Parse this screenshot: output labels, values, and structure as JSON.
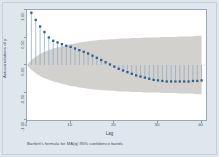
{
  "figure": {
    "note": "Bartlett's formula for MA(q) 95% confidence bands",
    "frame_color": "#dfe7ee",
    "plot_bg": "#ffffff"
  },
  "chart_data": {
    "type": "line",
    "plot_kind": "autocorrelation-spike-plot",
    "title": "",
    "xlabel": "Lag",
    "ylabel": "Autocorrelations of y",
    "xlim": [
      0,
      41
    ],
    "ylim": [
      -1.0,
      1.0
    ],
    "xticks": [
      0,
      10,
      20,
      30,
      40
    ],
    "xtick_labels": [
      "0",
      "10",
      "20",
      "30",
      "40"
    ],
    "yticks": [
      -1.0,
      -0.5,
      0.0,
      0.5,
      1.0
    ],
    "ytick_labels": [
      "-1.00",
      "-0.50",
      "0.00",
      "0.50",
      "1.00"
    ],
    "grid": false,
    "legend": false,
    "marker_color": "#33608f",
    "spike_color": "#8fa9c4",
    "band_color": "#b8b4ae",
    "band_label": "Bartlett's formula for MA(q) 95% confidence bands",
    "x": [
      1,
      2,
      3,
      4,
      5,
      6,
      7,
      8,
      9,
      10,
      11,
      12,
      13,
      14,
      15,
      16,
      17,
      18,
      19,
      20,
      21,
      22,
      23,
      24,
      25,
      26,
      27,
      28,
      29,
      30,
      31,
      32,
      33,
      34,
      35,
      36,
      37,
      38,
      39,
      40
    ],
    "values": [
      0.95,
      0.82,
      0.7,
      0.6,
      0.5,
      0.44,
      0.41,
      0.38,
      0.35,
      0.33,
      0.3,
      0.27,
      0.24,
      0.21,
      0.17,
      0.13,
      0.09,
      0.05,
      0.01,
      -0.03,
      -0.07,
      -0.1,
      -0.13,
      -0.16,
      -0.19,
      -0.21,
      -0.23,
      -0.25,
      -0.27,
      -0.28,
      -0.29,
      -0.3,
      -0.3,
      -0.3,
      -0.3,
      -0.3,
      -0.3,
      -0.29,
      -0.29,
      -0.28
    ],
    "confidence_upper": [
      0.09,
      0.15,
      0.2,
      0.24,
      0.27,
      0.3,
      0.32,
      0.34,
      0.36,
      0.38,
      0.39,
      0.41,
      0.42,
      0.43,
      0.44,
      0.45,
      0.46,
      0.46,
      0.47,
      0.47,
      0.48,
      0.48,
      0.48,
      0.49,
      0.49,
      0.49,
      0.5,
      0.5,
      0.5,
      0.5,
      0.51,
      0.51,
      0.51,
      0.51,
      0.52,
      0.52,
      0.52,
      0.52,
      0.53,
      0.53
    ],
    "confidence_lower": [
      -0.09,
      -0.15,
      -0.2,
      -0.24,
      -0.27,
      -0.3,
      -0.32,
      -0.34,
      -0.36,
      -0.38,
      -0.39,
      -0.41,
      -0.42,
      -0.43,
      -0.44,
      -0.45,
      -0.46,
      -0.46,
      -0.47,
      -0.47,
      -0.48,
      -0.48,
      -0.48,
      -0.49,
      -0.49,
      -0.49,
      -0.5,
      -0.5,
      -0.5,
      -0.5,
      -0.51,
      -0.51,
      -0.51,
      -0.51,
      -0.52,
      -0.52,
      -0.52,
      -0.52,
      -0.53,
      -0.53
    ]
  }
}
